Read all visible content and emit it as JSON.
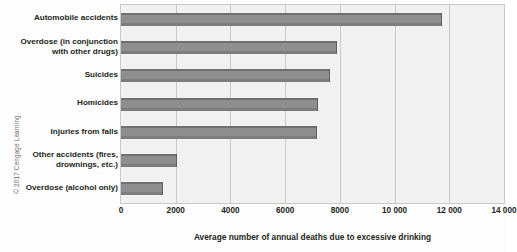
{
  "credit": "© 2017 Cengage Learning.",
  "chart_data": {
    "type": "bar",
    "orientation": "horizontal",
    "title": "",
    "xlabel": "Average number of annual deaths due to excessive drinking",
    "ylabel": "",
    "xlim": [
      0,
      14000
    ],
    "grid": true,
    "legend": "none",
    "bar_color": "#8e8e8e",
    "plot_background": "#f1f1f1",
    "grid_color": "#c9c9c9",
    "xticks": [
      0,
      2000,
      4000,
      6000,
      8000,
      10000,
      12000,
      14000
    ],
    "xtick_labels": [
      "0",
      "2000",
      "4000",
      "6000",
      "8000",
      "10 000",
      "12 000",
      "14 000"
    ],
    "categories": [
      "Automobile accidents",
      "Overdose (in conjunction\nwith other drugs)",
      "Suicides",
      "Homicides",
      "Injuries from falls",
      "Other accidents (fires,\ndrownings, etc.)",
      "Overdose (alcohol only)"
    ],
    "values": [
      11750,
      7900,
      7650,
      7200,
      7150,
      2050,
      1550
    ]
  }
}
